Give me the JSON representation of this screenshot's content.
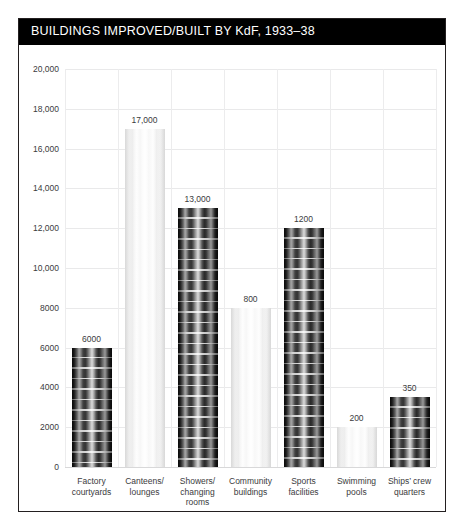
{
  "header": {
    "title": "BUILDINGS IMPROVED/BUILT BY KdF, 1933–38"
  },
  "chart_data": {
    "type": "bar",
    "title": "BUILDINGS IMPROVED/BUILT BY KdF, 1933–38",
    "xlabel": "",
    "ylabel": "",
    "ylim": [
      0,
      20000
    ],
    "grid": true,
    "legend": "none",
    "yticks": [
      0,
      2000,
      4000,
      6000,
      8000,
      10000,
      12000,
      14000,
      16000,
      18000,
      20000
    ],
    "ytick_labels": [
      "0",
      "2000",
      "4000",
      "6000",
      "8000",
      "10,000",
      "12,000",
      "14,000",
      "16,000",
      "18,000",
      "20,000"
    ],
    "categories": [
      "Factory courtyards",
      "Canteens/ lounges",
      "Showers/ changing rooms",
      "Community buildings",
      "Sports facilities",
      "Swimming pools",
      "Ships’ crew quarters"
    ],
    "category_lines": [
      [
        "Factory",
        "courtyards"
      ],
      [
        "Canteens/",
        "lounges"
      ],
      [
        "Showers/",
        "changing",
        "rooms"
      ],
      [
        "Community",
        "buildings"
      ],
      [
        "Sports",
        "facilities"
      ],
      [
        "Swimming",
        "pools"
      ],
      [
        "Ships’ crew",
        "quarters"
      ]
    ],
    "values": [
      6000,
      17000,
      13000,
      8000,
      12000,
      2000,
      3500
    ],
    "data_labels": [
      "6000",
      "17,000",
      "13,000",
      "800",
      "1200",
      "200",
      "350"
    ],
    "bar_styles": [
      "dark",
      "light",
      "dark",
      "light",
      "dark",
      "light",
      "dark"
    ]
  },
  "colors": {
    "title_bar_background": "#000000",
    "title_text": "#ffffff",
    "panel_border": "#231f20",
    "gridline": "#e9e9ea",
    "tick_text": "#3b3b3d",
    "bar_dark": "#1a1a1a",
    "bar_light": "#f1f1f1"
  }
}
